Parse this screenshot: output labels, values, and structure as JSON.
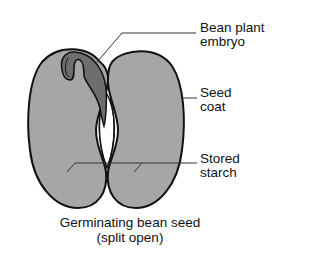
{
  "diagram": {
    "subject": "Germinating bean seed",
    "colors": {
      "cotyledon_fill": "#a6a6a6",
      "embryo_fill": "#6e6e6e",
      "outline": "#111111",
      "leader_line": "#333333",
      "background": "#ffffff"
    },
    "labels": [
      {
        "id": "embryo",
        "line1": "Bean plant",
        "line2": "embryo"
      },
      {
        "id": "seed-coat",
        "line1": "Seed",
        "line2": "coat"
      },
      {
        "id": "stored-starch",
        "line1": "Stored",
        "line2": "starch"
      }
    ],
    "caption": {
      "line1": "Germinating bean seed",
      "line2": "(split open)"
    }
  }
}
